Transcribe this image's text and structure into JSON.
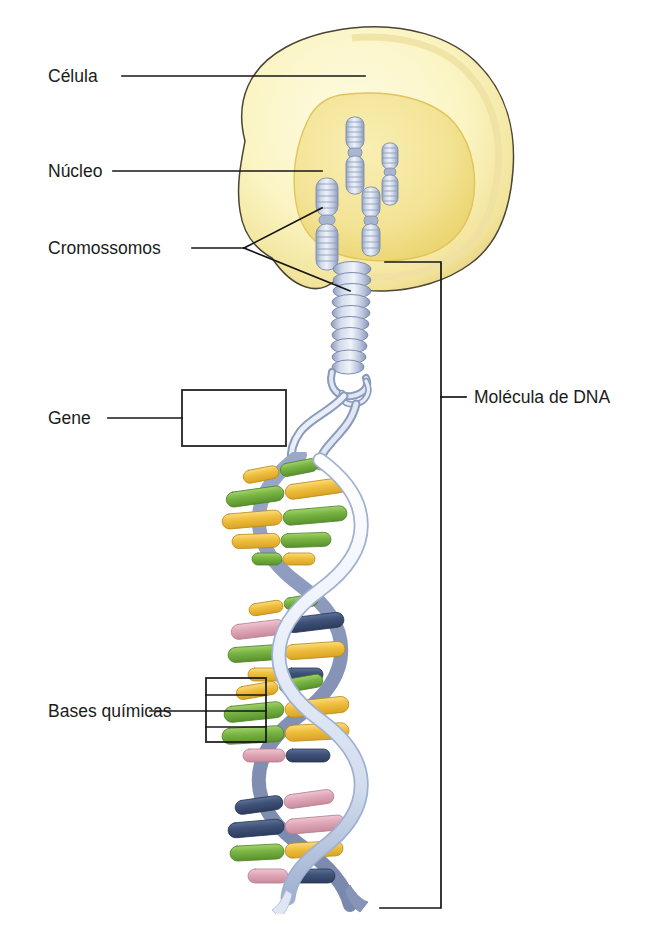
{
  "figure": {
    "language": "pt-BR",
    "background_color": "#ffffff"
  },
  "labels": {
    "cell": "Célula",
    "nucleus": "Núcleo",
    "chromosomes": "Cromossomos",
    "gene": "Gene",
    "chemical_bases": "Bases químicas",
    "dna_molecule": "Molécula de DNA"
  },
  "colors": {
    "cytoplasm_fill": "#fbf7cd",
    "cytoplasm_edge": "#e8d88a",
    "cytoplasm_outline": "#4a4534",
    "nucleus_fill": "#f5e79a",
    "nucleus_edge": "#e8d068",
    "chromosome_fill": "#c9d2e4",
    "chromosome_shade": "#97a5c2",
    "chromosome_outline": "#7e8cab",
    "backbone_light": "#e6eefa",
    "backbone_shade": "#8e9dc4",
    "base_green": "#79b544",
    "base_yellow": "#f0c040",
    "base_pink": "#e0a8b8",
    "base_navy": "#3f5278",
    "leader_line": "#161616"
  },
  "structures": {
    "cell": {
      "name": "cell-body",
      "shape": "irregular-rounded-blob"
    },
    "nucleus": {
      "name": "nucleus",
      "shape": "irregular-oval"
    },
    "chromosomes_in_nucleus": 4,
    "chromosome_exiting": 1,
    "supercoil_rings": 14,
    "helix_turns": 3.5
  },
  "base_pairs": [
    {
      "left": "yellow",
      "right": "green"
    },
    {
      "left": "green",
      "right": "yellow"
    },
    {
      "left": "yellow",
      "right": "green"
    },
    {
      "left": "green",
      "right": "yellow"
    },
    {
      "left": "yellow",
      "right": "green"
    },
    {
      "left": "pink",
      "right": "navy"
    },
    {
      "left": "green",
      "right": "yellow"
    },
    {
      "left": "yellow",
      "right": "navy"
    },
    {
      "left": "yellow",
      "right": "green"
    },
    {
      "left": "green",
      "right": "yellow"
    },
    {
      "left": "green",
      "right": "yellow"
    },
    {
      "left": "pink",
      "right": "navy"
    },
    {
      "left": "navy",
      "right": "pink"
    },
    {
      "left": "navy",
      "right": "pink"
    },
    {
      "left": "green",
      "right": "yellow"
    },
    {
      "left": "pink",
      "right": "navy"
    }
  ],
  "callouts": {
    "cell": {
      "leader": "straight-line",
      "points_to": "cytoplasm"
    },
    "nucleus": {
      "leader": "straight-line",
      "points_to": "nucleoplasm"
    },
    "chromosomes": {
      "leader": "forked-line",
      "branches": 2
    },
    "gene": {
      "leader": "line-to-box",
      "marker": "rectangle-bracket"
    },
    "chemical_bases": {
      "leader": "line-to-bracket",
      "marker": "rectangle-bracket-with-ticks",
      "ticks": 3
    },
    "dna_molecule": {
      "leader": "tick-on-bracket",
      "marker": "tall-vertical-bracket"
    }
  }
}
